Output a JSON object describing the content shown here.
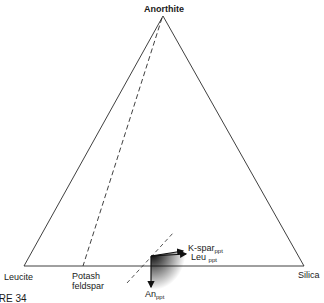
{
  "diagram": {
    "type": "ternary-phase-diagram",
    "vertices": {
      "top": "Anorthite",
      "left": "Leucite",
      "right": "Silica"
    },
    "join_point": {
      "label_line1": "Potash",
      "label_line2": "feldspar"
    },
    "vectors": {
      "kspar": {
        "label": "K-spar",
        "subscript": "ppt"
      },
      "leu": {
        "label": "Leu",
        "subscript": "ppt"
      },
      "an": {
        "label": "An",
        "subscript": "ppt"
      }
    },
    "figure_caption_fragment": "IRE 34"
  },
  "colors": {
    "line": "#2a2a2a",
    "background": "#ffffff"
  }
}
